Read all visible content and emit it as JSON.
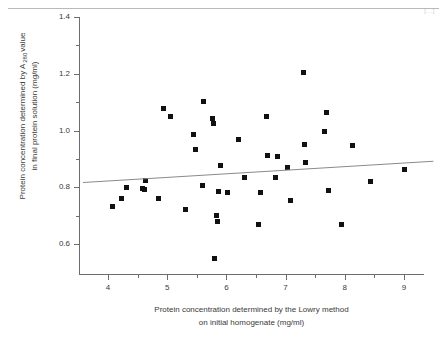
{
  "page": {
    "corner_marker": "[...]"
  },
  "chart_data": {
    "type": "scatter",
    "title": "",
    "xlabel": "Protein concentration determined by the Lowry method on initial homogenate (mg/ml)",
    "xlabel_line1": "Protein concentration determined by the Lowry method",
    "xlabel_line2": "on initial homogenate (mg/ml)",
    "ylabel": "Protein concentration determined by A 280 value in final protein solution (mg/ml)",
    "ylabel_line1_pre": "Protein concentration determined by A",
    "ylabel_line1_sub": "280",
    "ylabel_line1_post": "value",
    "ylabel_line2": "in final protein solution (mg/ml)",
    "xlim": [
      3.58,
      9.5
    ],
    "ylim": [
      0.51,
      1.4
    ],
    "xticks": [
      4,
      5,
      6,
      7,
      8,
      9
    ],
    "xtick_labels": [
      "4",
      "5",
      "6",
      "7",
      "8",
      "9"
    ],
    "xminor_ticks": [
      4.5,
      5.5,
      6.5,
      7.5,
      8.5
    ],
    "yticks": [
      0.6,
      0.8,
      1.0,
      1.2,
      1.4
    ],
    "ytick_labels": [
      "0.6",
      "0.8",
      "1.0",
      "1.2",
      "1.4"
    ],
    "yminor_ticks": [
      0.7,
      0.9,
      1.1,
      1.3
    ],
    "grid": false,
    "legend": null,
    "marker": "filled-square",
    "marker_color": "#111111",
    "trend_line": {
      "label": "regression line",
      "color": "#8a8a8a",
      "x": [
        3.58,
        9.5
      ],
      "y": [
        0.818,
        0.893
      ]
    },
    "points": [
      {
        "x": 4.08,
        "y": 0.733
      },
      {
        "x": 4.22,
        "y": 0.761
      },
      {
        "x": 4.31,
        "y": 0.8
      },
      {
        "x": 4.58,
        "y": 0.797
      },
      {
        "x": 4.62,
        "y": 0.793
      },
      {
        "x": 4.63,
        "y": 0.823
      },
      {
        "x": 4.85,
        "y": 0.761
      },
      {
        "x": 4.93,
        "y": 1.076
      },
      {
        "x": 5.05,
        "y": 1.049
      },
      {
        "x": 5.31,
        "y": 0.722
      },
      {
        "x": 5.45,
        "y": 0.985
      },
      {
        "x": 5.47,
        "y": 0.932
      },
      {
        "x": 5.59,
        "y": 0.805
      },
      {
        "x": 5.62,
        "y": 1.103
      },
      {
        "x": 5.77,
        "y": 1.044
      },
      {
        "x": 5.79,
        "y": 1.025
      },
      {
        "x": 5.8,
        "y": 0.549
      },
      {
        "x": 5.84,
        "y": 0.7
      },
      {
        "x": 5.85,
        "y": 0.681
      },
      {
        "x": 5.87,
        "y": 0.786
      },
      {
        "x": 5.9,
        "y": 0.878
      },
      {
        "x": 6.02,
        "y": 0.781
      },
      {
        "x": 6.21,
        "y": 0.969
      },
      {
        "x": 6.3,
        "y": 0.835
      },
      {
        "x": 6.55,
        "y": 0.668
      },
      {
        "x": 6.57,
        "y": 0.781
      },
      {
        "x": 6.67,
        "y": 1.051
      },
      {
        "x": 6.7,
        "y": 0.913
      },
      {
        "x": 6.83,
        "y": 0.833
      },
      {
        "x": 6.87,
        "y": 0.908
      },
      {
        "x": 7.04,
        "y": 0.869
      },
      {
        "x": 7.09,
        "y": 0.752
      },
      {
        "x": 7.3,
        "y": 1.206
      },
      {
        "x": 7.32,
        "y": 0.951
      },
      {
        "x": 7.33,
        "y": 0.888
      },
      {
        "x": 7.66,
        "y": 0.997
      },
      {
        "x": 7.69,
        "y": 1.062
      },
      {
        "x": 7.72,
        "y": 0.789
      },
      {
        "x": 7.95,
        "y": 0.667
      },
      {
        "x": 8.13,
        "y": 0.946
      },
      {
        "x": 8.43,
        "y": 0.82
      },
      {
        "x": 9.0,
        "y": 0.864
      }
    ]
  }
}
